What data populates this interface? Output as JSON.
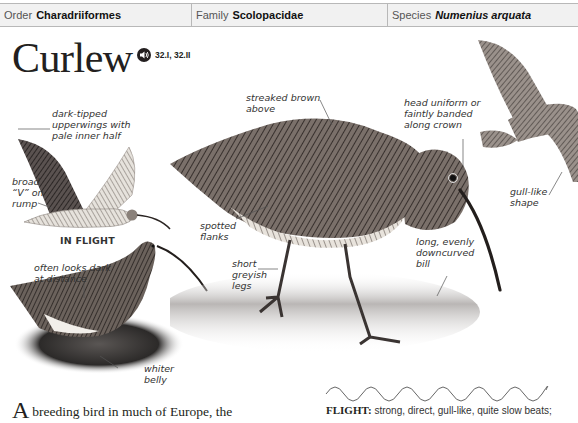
{
  "taxonomy": {
    "order": {
      "label": "Order",
      "value": "Charadriiformes"
    },
    "family": {
      "label": "Family",
      "value": "Scolopacidae"
    },
    "species": {
      "label": "Species",
      "value": "Numenius arquata"
    }
  },
  "species_title": "Curlew",
  "audio": {
    "icon": "speaker-icon",
    "tracks": "32.I, 32.II"
  },
  "annotations": {
    "upperwings": "dark-tipped\nupperwings with\npale inner half",
    "rump": "broad\n“V” on\nrump",
    "in_flight": "IN FLIGHT",
    "dark_distance": "often looks dark\nat distance",
    "whiter_belly": "whiter\nbelly",
    "streaked": "streaked brown\nabove",
    "head": "head uniform or\nfaintly banded\nalong crown",
    "spotted_flanks": "spotted\nflanks",
    "legs": "short\ngreyish\nlegs",
    "bill": "long, evenly\ndowncurved\nbill",
    "gull_like": "gull-like\nshape"
  },
  "body_text": {
    "dropcap": "A",
    "text": "breeding bird in much of Europe, the"
  },
  "flight": {
    "keyword": "FLIGHT:",
    "text": "strong, direct, gull-like, quite slow beats;"
  },
  "colors": {
    "header_bg": "#f1f1f1",
    "header_border": "#b8b8b8",
    "text": "#231f20"
  }
}
